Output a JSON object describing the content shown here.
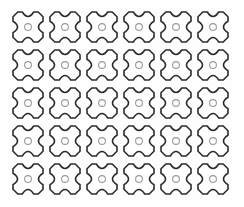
{
  "artwork": {
    "title": "Seamless Four-Pointed Star Cross Pattern",
    "description": "Monochrome line-art grid of repeating quatrefoil X-shaped motifs, each with a small ring at its center",
    "motif_name": "star-cross-motif",
    "icon_name": "star-cross-icon"
  },
  "canvas": {
    "width": 244,
    "height": 207,
    "background_color": "#fefefe"
  },
  "grid": {
    "columns": 6,
    "rows": 5,
    "total_motifs": 30,
    "origin_x": 13,
    "origin_y": 12,
    "column_pitch": 37,
    "row_pitch": 38,
    "motif_width": 30,
    "motif_height": 30
  },
  "style": {
    "outline_color": "#2b2b2b",
    "outline_width": 1.6,
    "fill_color": "#ffffff",
    "ring_color": "#9a9a9a",
    "ring_width": 1.1,
    "ring_radius": 3.4
  },
  "motif_geometry": {
    "arm_half_width": 0.19,
    "notch_depth": 0.3,
    "notch_control": 0.2,
    "tip_flat": 0.16
  }
}
